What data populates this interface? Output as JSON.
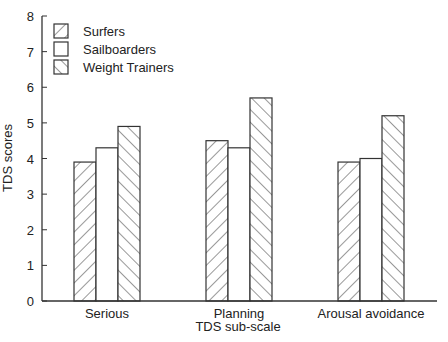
{
  "chart_data": {
    "type": "bar",
    "title": "",
    "xlabel": "TDS sub-scale",
    "ylabel": "TDS scores",
    "ylim": [
      0,
      8
    ],
    "yticks": [
      0,
      1,
      2,
      3,
      4,
      5,
      6,
      7,
      8
    ],
    "grid": false,
    "legend_position": "upper left",
    "categories": [
      "Serious",
      "Planning",
      "Arousal avoidance"
    ],
    "series": [
      {
        "name": "Surfers",
        "pattern": "backslash-hatch",
        "values": [
          3.9,
          4.5,
          3.9
        ]
      },
      {
        "name": "Sailboarders",
        "pattern": "none",
        "values": [
          4.3,
          4.3,
          4.0
        ]
      },
      {
        "name": "Weight Trainers",
        "pattern": "slash-hatch",
        "values": [
          4.9,
          5.7,
          5.2
        ]
      }
    ]
  },
  "colors": {
    "stroke": "#333333",
    "background": "#ffffff"
  }
}
